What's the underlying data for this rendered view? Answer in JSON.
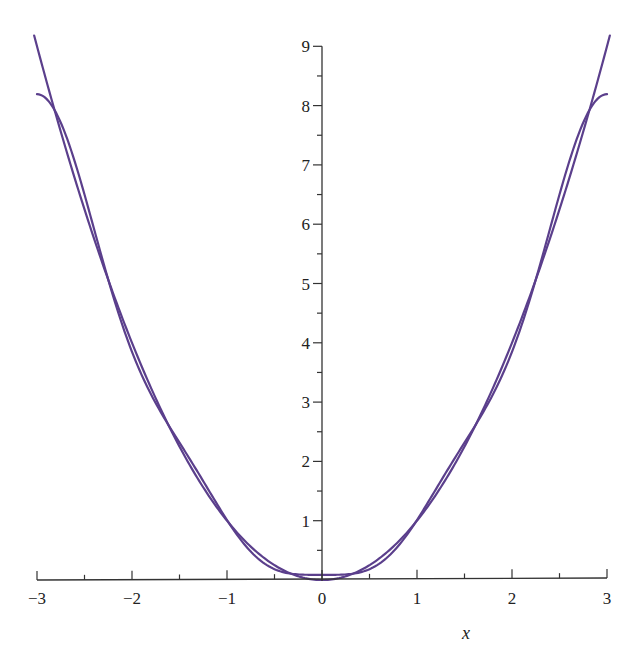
{
  "chart_data": {
    "type": "line",
    "title": "",
    "xlabel": "x",
    "ylabel": "",
    "xlim": [
      -3,
      3
    ],
    "ylim": [
      0,
      9
    ],
    "grid": false,
    "legend": null,
    "x_ticks": [
      -3,
      -2,
      -1,
      0,
      1,
      2,
      3
    ],
    "x_tick_labels": [
      "−3",
      "−2",
      "−1",
      "0",
      "1",
      "2",
      "3"
    ],
    "y_ticks": [
      1,
      2,
      3,
      4,
      5,
      6,
      7,
      8,
      9
    ],
    "y_tick_labels": [
      "1",
      "2",
      "3",
      "4",
      "5",
      "6",
      "7",
      "8",
      "9"
    ],
    "series": [
      {
        "name": "x^2",
        "color": "#5b3f8c",
        "x": [
          -3,
          -2.5,
          -2,
          -1.5,
          -1,
          -0.5,
          0,
          0.5,
          1,
          1.5,
          2,
          2.5,
          3
        ],
        "y": [
          9,
          6.25,
          4,
          2.25,
          1,
          0.25,
          0,
          0.25,
          1,
          2.25,
          4,
          6.25,
          9
        ]
      },
      {
        "name": "Fourier partial sum of x^2 on [-3,3]",
        "color": "#5b3f8c",
        "x": [
          -3,
          -2.5,
          -2,
          -1.5,
          -1,
          -0.5,
          0,
          0.5,
          1,
          1.5,
          2,
          2.5,
          3
        ],
        "y": [
          8.3,
          6.3,
          3.95,
          2.3,
          1.0,
          0.2,
          -0.1,
          0.2,
          1.0,
          2.3,
          3.95,
          6.3,
          8.3
        ]
      }
    ]
  },
  "layout": {
    "origin_px": [
      322,
      580
    ],
    "x_unit_px": 95,
    "y_unit_px": 59.3,
    "curve_color": "#5b3f8c",
    "axis_color": "#333333"
  }
}
